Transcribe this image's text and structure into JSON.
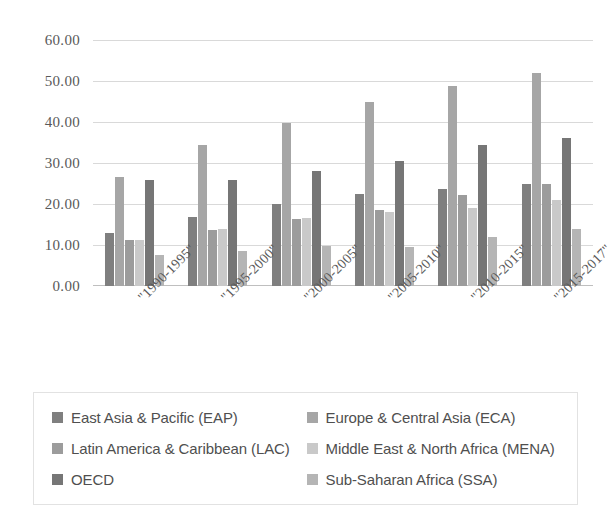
{
  "chart_data": {
    "type": "bar",
    "title": "",
    "subtitle": "",
    "xlabel": "",
    "ylabel": "",
    "ylim": [
      0,
      60
    ],
    "ytick_step": 10,
    "ytick_labels": [
      "60.00",
      "50.00",
      "40.00",
      "30.00",
      "20.00",
      "10.00",
      "0.00"
    ],
    "ytick_values": [
      60,
      50,
      40,
      30,
      20,
      10,
      0
    ],
    "grid": true,
    "legend_position": "bottom",
    "categories": [
      "\"1990-1995\"",
      "\"1995-2000\"",
      "\"2000-2005\"",
      "\"2005-2010\"",
      "\"2010-2015\"",
      "\"2015-2017\""
    ],
    "series": [
      {
        "name": "East Asia & Pacific (EAP)",
        "color": "#7f7f7f",
        "values": [
          13.0,
          16.8,
          20.0,
          22.5,
          23.6,
          24.9
        ]
      },
      {
        "name": "Europe & Central Asia (ECA)",
        "color": "#a6a6a6",
        "values": [
          26.5,
          34.5,
          39.8,
          44.8,
          48.8,
          52.0
        ]
      },
      {
        "name": "Latin America & Caribbean (LAC)",
        "color": "#9c9c9c",
        "values": [
          11.3,
          13.6,
          16.3,
          18.5,
          22.2,
          25.0
        ]
      },
      {
        "name": "Middle East & North Africa (MENA)",
        "color": "#c9c9c9",
        "values": [
          11.2,
          14.0,
          16.6,
          18.1,
          19.1,
          21.0
        ]
      },
      {
        "name": "OECD",
        "color": "#767676",
        "values": [
          25.9,
          25.9,
          28.0,
          30.6,
          34.4,
          36.1
        ]
      },
      {
        "name": "Sub-Saharan Africa (SSA)",
        "color": "#b5b5b5",
        "values": [
          7.5,
          8.5,
          9.8,
          9.5,
          12.0,
          13.8
        ]
      }
    ]
  },
  "legend": {
    "items": [
      {
        "label": "East Asia & Pacific (EAP)",
        "color": "#7f7f7f"
      },
      {
        "label": "Europe & Central Asia (ECA)",
        "color": "#a6a6a6"
      },
      {
        "label": "Latin America & Caribbean (LAC)",
        "color": "#9c9c9c"
      },
      {
        "label": "Middle East & North Africa (MENA)",
        "color": "#c9c9c9"
      },
      {
        "label": "OECD",
        "color": "#767676"
      },
      {
        "label": "Sub-Saharan Africa (SSA)",
        "color": "#b5b5b5"
      }
    ]
  }
}
